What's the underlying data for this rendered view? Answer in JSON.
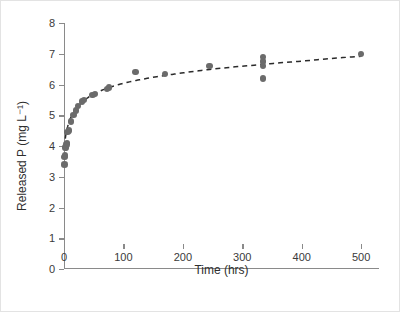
{
  "chart_data": {
    "type": "scatter",
    "title": "",
    "xlabel": "Time (hrs)",
    "ylabel": "Released P (mg L⁻¹)",
    "xlim": [
      0,
      530
    ],
    "ylim": [
      0,
      8
    ],
    "xticks": [
      0,
      100,
      200,
      300,
      400,
      500
    ],
    "xtick_labels": [
      "0",
      "100",
      "200",
      "300",
      "400",
      "500"
    ],
    "yticks": [
      0,
      1,
      2,
      3,
      4,
      5,
      6,
      7,
      8
    ],
    "ytick_labels": [
      "0",
      "1",
      "2",
      "3",
      "4",
      "5",
      "6",
      "7",
      "8"
    ],
    "grid": false,
    "legend": false,
    "marker_color": "#6b6b6b",
    "fit_line_color": "#2b2b2b",
    "fit_line_style": "dashed",
    "series": [
      {
        "name": "Released P",
        "marker": "filled-circle",
        "x": [
          1,
          1,
          2,
          2,
          3,
          3,
          4,
          5,
          6,
          8,
          12,
          16,
          20,
          24,
          30,
          34,
          48,
          52,
          72,
          76,
          120,
          170,
          245,
          335,
          335,
          335,
          335,
          500
        ],
        "y": [
          3.4,
          3.65,
          3.7,
          3.95,
          3.95,
          4.0,
          4.05,
          4.1,
          4.45,
          4.5,
          4.8,
          5.0,
          5.15,
          5.3,
          5.45,
          5.5,
          5.65,
          5.7,
          5.85,
          5.9,
          6.4,
          6.35,
          6.6,
          6.9,
          6.75,
          6.6,
          6.2,
          7.0
        ]
      }
    ],
    "fit_curve": {
      "name": "logarithmic fit",
      "x": [
        1,
        3,
        6,
        10,
        16,
        24,
        34,
        48,
        70,
        100,
        140,
        190,
        250,
        320,
        400,
        500
      ],
      "y": [
        3.95,
        4.35,
        4.62,
        4.86,
        5.08,
        5.3,
        5.48,
        5.67,
        5.86,
        6.04,
        6.2,
        6.35,
        6.5,
        6.63,
        6.76,
        6.92
      ]
    }
  }
}
